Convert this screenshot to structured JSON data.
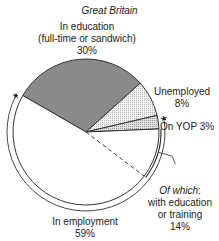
{
  "chart_data": {
    "type": "pie",
    "title": "Great Britain",
    "slices": [
      {
        "name": "In education (full-time or sandwich)",
        "label_lines": [
          "In education",
          "(full-time or sandwich)",
          "30%"
        ],
        "value": 30,
        "fill": "dark-grey"
      },
      {
        "name": "Unemployed",
        "label_lines": [
          "Unemployed",
          "8%"
        ],
        "value": 8,
        "fill": "light-stipple"
      },
      {
        "name": "On YOP",
        "label_lines": [
          "On YOP 3%"
        ],
        "value": 3,
        "fill": "medium-stipple"
      },
      {
        "name": "In employment",
        "label_lines": [
          "In employment",
          "59%"
        ],
        "value": 59,
        "fill": "white"
      }
    ],
    "sub_annotation": {
      "of_which": "Of which",
      "colon": ":",
      "label_lines": [
        "with education",
        "or training",
        "14%"
      ],
      "value": 14,
      "parent": "In employment plus On YOP arc"
    },
    "colors": {
      "dark": "#8a8a8a",
      "light": "#e6e6e6",
      "medium": "#d2d2d2",
      "white": "#ffffff",
      "stroke": "#333333"
    }
  }
}
